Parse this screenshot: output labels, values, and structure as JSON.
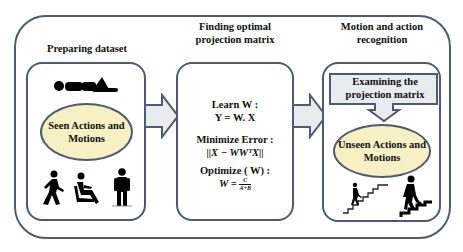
{
  "diagram": {
    "stages": [
      {
        "title": "Preparing dataset",
        "ellipse_label": "Seen Actions and Motions",
        "icons": [
          "lying-person-icon",
          "walking-person-icon",
          "sitting-person-icon",
          "standing-person-icon"
        ]
      },
      {
        "title": "Finding optimal projection matrix",
        "steps": [
          {
            "label": "Learn W :",
            "formula": "Y = W. X"
          },
          {
            "label": "Minimize Error :",
            "formula": "||X − WWᵀX||"
          },
          {
            "label": "Optimize ( W) :",
            "formula_lhs": "W =",
            "formula_num": "C",
            "formula_den": "A+B"
          }
        ]
      },
      {
        "title": "Motion and action recognition",
        "callout_label": "Examining the projection matrix",
        "ellipse_label": "Unseen Actions and Motions",
        "icons": [
          "climbing-stairs-icon",
          "descending-stairs-icon"
        ]
      }
    ],
    "arrows": [
      "stage1-to-stage2",
      "stage2-to-stage3"
    ],
    "colors": {
      "border": "#4e5a72",
      "ellipse_fill": "#f6f0c4",
      "arrow_fill": "#e8ecef",
      "text": "#111111"
    }
  }
}
